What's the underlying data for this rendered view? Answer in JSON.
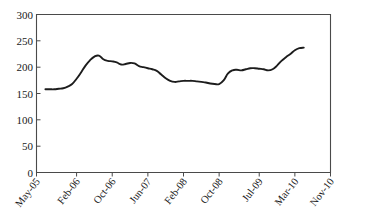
{
  "chart_data": {
    "type": "line",
    "title": "",
    "subtitle": "",
    "xlabel": "",
    "ylabel": "",
    "ylim": [
      0,
      300
    ],
    "ytick_labels": [
      "0",
      "50",
      "100",
      "150",
      "200",
      "250",
      "300"
    ],
    "ytick_values": [
      0,
      50,
      100,
      150,
      200,
      250,
      300
    ],
    "xtick_labels": [
      "May-05",
      "Feb-06",
      "Oct-06",
      "Jun-07",
      "Feb-08",
      "Oct-08",
      "Jul-09",
      "Mar-10",
      "Nov-10"
    ],
    "xtick_values": [
      0,
      9,
      17,
      25,
      33,
      41,
      50,
      58,
      66
    ],
    "grid": false,
    "legend": false,
    "legend_position": "none",
    "series": [
      {
        "name": "series-1",
        "x": [
          2,
          3,
          4,
          5,
          6,
          7,
          8,
          9,
          10,
          11,
          12,
          13,
          14,
          15,
          16,
          17,
          18,
          19,
          20,
          21,
          22,
          23,
          24,
          25,
          26,
          27,
          28,
          29,
          30,
          31,
          32,
          33,
          34,
          35,
          36,
          37,
          38,
          39,
          40,
          41,
          42,
          43,
          44,
          45,
          46,
          47,
          48,
          49,
          50,
          51,
          52,
          53,
          54,
          55,
          56,
          57,
          58,
          59,
          60
        ],
        "values": [
          158,
          158,
          158,
          159,
          160,
          163,
          168,
          178,
          190,
          203,
          213,
          220,
          222,
          215,
          212,
          211,
          209,
          205,
          206,
          208,
          207,
          202,
          200,
          198,
          196,
          193,
          186,
          179,
          174,
          172,
          173,
          174,
          174,
          174,
          173,
          172,
          171,
          169,
          168,
          168,
          175,
          188,
          194,
          195,
          194,
          196,
          198,
          198,
          197,
          196,
          194,
          196,
          203,
          212,
          219,
          225,
          232,
          236,
          237
        ]
      }
    ]
  },
  "axes": {
    "y_axis_name": "y-axis",
    "x_axis_name": "x-axis"
  }
}
